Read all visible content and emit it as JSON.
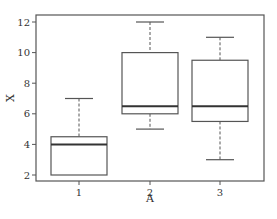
{
  "chart_data": {
    "type": "box",
    "title": "",
    "xlabel": "A",
    "ylabel": "X",
    "categories": [
      "1",
      "2",
      "3"
    ],
    "ylim": [
      1.7,
      12.5
    ],
    "yticks": [
      2,
      4,
      6,
      8,
      10,
      12
    ],
    "grid": false,
    "legend": null,
    "boxes": [
      {
        "category": "1",
        "whisker_low": 2,
        "q1": 2,
        "median": 4,
        "q3": 4.5,
        "whisker_high": 7
      },
      {
        "category": "2",
        "whisker_low": 5,
        "q1": 6,
        "median": 6.5,
        "q3": 10,
        "whisker_high": 12
      },
      {
        "category": "3",
        "whisker_low": 3,
        "q1": 5.5,
        "median": 6.5,
        "q3": 9.5,
        "whisker_high": 11
      }
    ]
  },
  "style": {
    "line_color": "#555555",
    "median_color": "#333333",
    "background": "#ffffff"
  }
}
